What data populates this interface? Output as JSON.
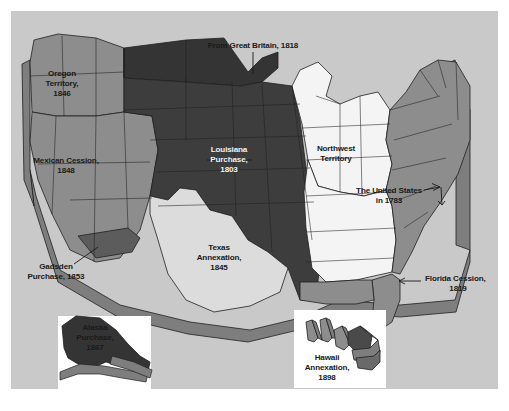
{
  "figure": {
    "kind": "historical-map",
    "background_color": "#c9c9c9",
    "page_color": "#ffffff",
    "top_cropped_text": ""
  },
  "palette": {
    "page": "#ffffff",
    "panel": "#c9c9c9",
    "outline": "#1f1f1f",
    "tone_darkest": "#343434",
    "tone_dark": "#3d3d3d",
    "tone_medium": "#8d8d8d",
    "tone_medium_light": "#a3a3a3",
    "tone_light": "#dcdcdc",
    "tone_white": "#f4f4f4",
    "extrusion_side": "#7e7e7e",
    "extrusion_shadow": "#6a6a6a",
    "inset_box": "#ffffff",
    "label_dark": "#1a1a1a",
    "label_light": "#f2f2f2"
  },
  "regions": [
    {
      "id": "oregon-territory",
      "label_lines": [
        "Oregon",
        "Territory,",
        "1846"
      ],
      "year": "1846",
      "fill": "#8d8d8d",
      "label_color": "dark",
      "label_x": 62,
      "label_y": 84
    },
    {
      "id": "mexican-cession",
      "label_lines": [
        "Mexican Cession,",
        "1848"
      ],
      "year": "1848",
      "fill": "#8d8d8d",
      "label_color": "dark",
      "label_x": 66,
      "label_y": 166
    },
    {
      "id": "louisiana-purchase",
      "label_lines": [
        "Louisiana",
        "Purchase,",
        "1803"
      ],
      "year": "1803",
      "fill": "#3d3d3d",
      "label_color": "light",
      "label_x": 229,
      "label_y": 160
    },
    {
      "id": "texas-annexation",
      "label_lines": [
        "Texas",
        "Annexation,",
        "1845"
      ],
      "year": "1845",
      "fill": "#dcdcdc",
      "label_color": "dark",
      "label_x": 219,
      "label_y": 258
    },
    {
      "id": "northwest-territory",
      "label_lines": [
        "Northwest",
        "Territory"
      ],
      "year": "",
      "fill": "#f4f4f4",
      "label_color": "dark",
      "label_x": 336,
      "label_y": 154
    }
  ],
  "callouts": [
    {
      "id": "from-great-britain",
      "label_lines": [
        "From Great Britain, 1818"
      ],
      "year": "1818",
      "anchor": "mid",
      "text_x": 253,
      "text_y": 46,
      "leader": "M253,52 L253,74"
    },
    {
      "id": "united-states-1783",
      "label_lines": [
        "The United States",
        "in 1783"
      ],
      "year": "1783",
      "anchor": "mid",
      "text_x": 389,
      "text_y": 196,
      "leader": "M424,190 L440,187 M432,186 L440,187 L433,191 M440,187 L441,204 M437,201 L441,204 L444,201"
    },
    {
      "id": "gadsden-purchase",
      "label_lines": [
        "Gadsden",
        "Purchase, 1853"
      ],
      "year": "1853",
      "anchor": "mid",
      "text_x": 56,
      "text_y": 272,
      "leader": "M74,264 L98,247"
    },
    {
      "id": "florida-cession",
      "label_lines": [
        "Florida Cession,",
        "1819"
      ],
      "year": "1819",
      "anchor": "start",
      "text_x": 425,
      "text_y": 284,
      "leader": "M421,281 L399,281 M405,278 L399,281 L405,284"
    }
  ],
  "insets": [
    {
      "id": "alaska-purchase",
      "label_lines": [
        "Alaska",
        "Purchase,",
        "1867"
      ],
      "year": "1867",
      "box": {
        "x": 58,
        "y": 316,
        "w": 93,
        "h": 73
      },
      "fill": "#343434",
      "label_color": "dark",
      "label_x": 95,
      "label_y": 333
    },
    {
      "id": "hawaii-annexation",
      "label_lines": [
        "Hawaii",
        "Annexation,",
        "1898"
      ],
      "year": "1898",
      "box": {
        "x": 294,
        "y": 310,
        "w": 92,
        "h": 78
      },
      "fill": "#8d8d8d",
      "label_color": "dark",
      "label_x": 327,
      "label_y": 363
    }
  ]
}
